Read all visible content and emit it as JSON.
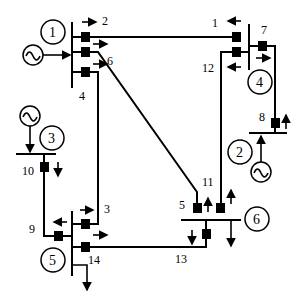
{
  "diagram": {
    "buses": [
      {
        "id": "1",
        "label": "1"
      },
      {
        "id": "2",
        "label": "2"
      },
      {
        "id": "3",
        "label": "3"
      },
      {
        "id": "4",
        "label": "4"
      },
      {
        "id": "5",
        "label": "5"
      },
      {
        "id": "6",
        "label": "6"
      }
    ],
    "generators": [
      {
        "bus": "1",
        "icon": "ac-generator-icon"
      },
      {
        "bus": "2",
        "icon": "ac-generator-icon"
      },
      {
        "bus": "3",
        "icon": "ac-generator-icon"
      }
    ],
    "breakers": [
      {
        "label": "1"
      },
      {
        "label": "2"
      },
      {
        "label": "3"
      },
      {
        "label": "4"
      },
      {
        "label": "5"
      },
      {
        "label": "6"
      },
      {
        "label": "7"
      },
      {
        "label": "8"
      },
      {
        "label": "9"
      },
      {
        "label": "10"
      },
      {
        "label": "11"
      },
      {
        "label": "12"
      },
      {
        "label": "13"
      },
      {
        "label": "14"
      }
    ],
    "lines": [
      {
        "from": "1",
        "to": "4",
        "breakers": [
          "2",
          "1"
        ]
      },
      {
        "from": "1",
        "to": "6",
        "breakers": [
          "6",
          "5"
        ]
      },
      {
        "from": "1",
        "to": "5",
        "breakers": [
          "4",
          "3"
        ]
      },
      {
        "from": "4",
        "to": "2",
        "breakers": [
          "7",
          "8"
        ]
      },
      {
        "from": "4",
        "to": "6",
        "breakers": [
          "12",
          "11"
        ]
      },
      {
        "from": "3",
        "to": "5",
        "breakers": [
          "10",
          "9"
        ]
      },
      {
        "from": "5",
        "to": "6",
        "breakers": [
          "14",
          "13"
        ]
      }
    ]
  }
}
